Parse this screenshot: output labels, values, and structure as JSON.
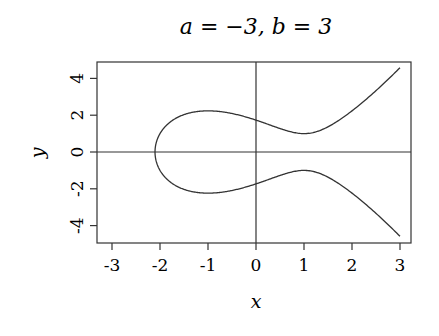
{
  "chart_data": {
    "type": "line",
    "title": "a = −3, b = 3",
    "xlabel": "x",
    "ylabel": "y",
    "equation": "y^2 = x^3 + a x + b",
    "params": {
      "a": -3,
      "b": 3
    },
    "xlim": [
      -3.3,
      3.2
    ],
    "ylim": [
      -4.9,
      4.9
    ],
    "x_ticks": [
      -3,
      -2,
      -1,
      0,
      1,
      2,
      3
    ],
    "x_tick_labels": [
      "-3",
      "-2",
      "-1",
      "0",
      "1",
      "2",
      "3"
    ],
    "y_ticks": [
      -4,
      -2,
      0,
      2,
      4
    ],
    "y_tick_labels": [
      "-4",
      "-2",
      "0",
      "2",
      "4"
    ],
    "grid": false,
    "reference_lines": {
      "x": 0,
      "y": 0
    },
    "series": [
      {
        "name": "upper branch",
        "x": [
          -2.1,
          -2.0,
          -1.5,
          -1.0,
          -0.5,
          0.0,
          0.5,
          1.0,
          1.5,
          2.0,
          2.5,
          3.0
        ],
        "y": [
          0.0,
          1.0,
          2.06,
          2.24,
          2.09,
          1.73,
          1.37,
          1.0,
          1.17,
          2.24,
          3.35,
          4.58
        ]
      },
      {
        "name": "lower branch",
        "x": [
          -2.1,
          -2.0,
          -1.5,
          -1.0,
          -0.5,
          0.0,
          0.5,
          1.0,
          1.5,
          2.0,
          2.5,
          3.0
        ],
        "y": [
          0.0,
          -1.0,
          -2.06,
          -2.24,
          -2.09,
          -1.73,
          -1.37,
          -1.0,
          -1.17,
          -2.24,
          -3.35,
          -4.58
        ]
      }
    ],
    "legend": null
  }
}
